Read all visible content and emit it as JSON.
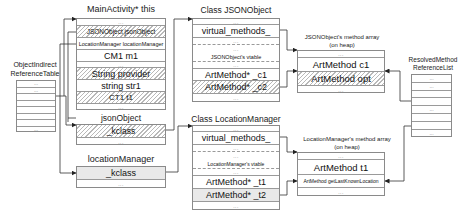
{
  "object_indirect_reference_table": {
    "title_line1": "ObjectIndirect",
    "title_line2": "ReferenceTable",
    "rows": [
      "...",
      "...",
      "",
      "",
      "",
      "",
      "",
      "..."
    ]
  },
  "main_activity": {
    "title": "MainActivity* this",
    "rows": [
      {
        "text": "...",
        "style": "dots"
      },
      {
        "text": "JSONObject jsonObject",
        "style": "hatch"
      },
      {
        "text": "LocationManager locationManager",
        "style": "plain"
      },
      {
        "text": "CM1 m1",
        "style": "plain"
      },
      {
        "text": "...",
        "style": "dots"
      },
      {
        "text": "String provider",
        "style": "hatch"
      },
      {
        "text": "string  str1",
        "style": "plain"
      },
      {
        "text": "CT1 t1",
        "style": "hatch"
      },
      {
        "text": "...",
        "style": "dots"
      }
    ]
  },
  "json_object_instance": {
    "title": "jsonObject",
    "rows": [
      {
        "text": "_kclass",
        "style": "hatch"
      },
      {
        "text": "...",
        "style": "dots"
      }
    ]
  },
  "location_manager_instance": {
    "title": "locationManager",
    "rows": [
      {
        "text": "_kclass",
        "style": "gray"
      },
      {
        "text": "...",
        "style": "dots"
      }
    ]
  },
  "class_json_object": {
    "title": "Class JSONObject",
    "rows": [
      {
        "text": "...",
        "style": "dots"
      },
      {
        "text": "virtual_methods_",
        "style": "plain"
      },
      {
        "text": "...",
        "style": "dots"
      },
      {
        "text": "...",
        "style": "dots"
      },
      {
        "text": "JSONObject's vtable",
        "style": "plain"
      },
      {
        "text": "...",
        "style": "dots"
      },
      {
        "text": "ArtMethod*  _c1",
        "style": "plain"
      },
      {
        "text": "ArtMethod*  _c2",
        "style": "hatch"
      },
      {
        "text": "...",
        "style": "dots"
      }
    ]
  },
  "class_location_manager": {
    "title": "Class LocationManager",
    "rows": [
      {
        "text": "...",
        "style": "dots"
      },
      {
        "text": "virtual_methods_",
        "style": "plain"
      },
      {
        "text": "...",
        "style": "dots"
      },
      {
        "text": "...",
        "style": "dots"
      },
      {
        "text": "LocationManager's vtable",
        "style": "plain"
      },
      {
        "text": "...",
        "style": "dots"
      },
      {
        "text": "ArtMethod*  _t1",
        "style": "plain"
      },
      {
        "text": "ArtMethod*  _t2",
        "style": "gray"
      },
      {
        "text": "...",
        "style": "dots"
      }
    ]
  },
  "json_method_array": {
    "title_line1": "JSONObject's method array",
    "title_line2": "(on heap)",
    "rows": [
      {
        "text": "...",
        "style": "dots"
      },
      {
        "text": "ArtMethod c1",
        "style": "plain"
      },
      {
        "text": "ArtMethod opt",
        "style": "hatch"
      },
      {
        "text": "...",
        "style": "dots"
      }
    ]
  },
  "location_method_array": {
    "title_line1": "LocationManager's method array",
    "title_line2": "(on heap)",
    "rows": [
      {
        "text": "...",
        "style": "dots"
      },
      {
        "text": "ArtMethod t1",
        "style": "plain"
      },
      {
        "text": "ArtMethod getLastKnownLocation",
        "style": "plain"
      },
      {
        "text": "...",
        "style": "dots"
      }
    ]
  },
  "resolved_method_reference_list": {
    "title_line1": "ResolvedMethod",
    "title_line2": "ReferenceList",
    "rows": [
      "...",
      "...",
      "",
      "",
      "...",
      "",
      "",
      "..."
    ]
  },
  "colors": {
    "border": "#8a8a8a",
    "hatch": "#b9b9b9",
    "gray_fill": "#e9e9e9",
    "wire": "#333333"
  }
}
